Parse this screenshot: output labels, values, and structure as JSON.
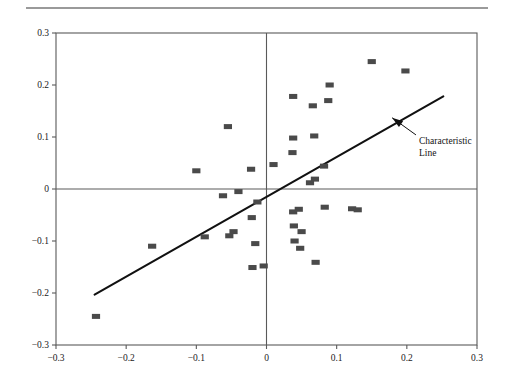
{
  "figure": {
    "title": "",
    "top_rule_color": "#9a9a9a",
    "background_color": "#ffffff"
  },
  "annotation": {
    "line1": "Characteristic",
    "line2": "Line"
  },
  "chart_data": {
    "type": "scatter",
    "title": "",
    "xlabel": "",
    "ylabel": "",
    "xlim": [
      -0.3,
      0.3
    ],
    "ylim": [
      -0.3,
      0.3
    ],
    "grid": false,
    "legend": null,
    "marker_color": "#4a4a4a",
    "marker_shape": "square",
    "axis_color": "#5a5a5a",
    "line_color": "#111111",
    "xticks": [
      -0.3,
      -0.2,
      -0.1,
      0,
      0.1,
      0.2,
      0.3
    ],
    "xtick_labels": [
      "-0.3",
      "-0.2",
      "-0.1",
      "0",
      "0.1",
      "0.2",
      "0.3"
    ],
    "yticks": [
      -0.3,
      -0.2,
      -0.1,
      0,
      0.1,
      0.2,
      0.3
    ],
    "ytick_labels": [
      "-0.3",
      "-0.2",
      "-0.1",
      "0",
      "0.1",
      "0.2",
      "0.3"
    ],
    "zero_lines": {
      "x": 0,
      "y": 0
    },
    "points": [
      [
        -0.243,
        -0.245
      ],
      [
        -0.163,
        -0.11
      ],
      [
        -0.1,
        0.035
      ],
      [
        -0.088,
        -0.092
      ],
      [
        -0.062,
        -0.013
      ],
      [
        -0.055,
        0.12
      ],
      [
        -0.053,
        -0.09
      ],
      [
        -0.047,
        -0.082
      ],
      [
        -0.04,
        -0.005
      ],
      [
        -0.022,
        0.038
      ],
      [
        -0.021,
        -0.055
      ],
      [
        -0.02,
        -0.151
      ],
      [
        -0.016,
        -0.105
      ],
      [
        -0.013,
        -0.025
      ],
      [
        -0.004,
        -0.148
      ],
      [
        0.01,
        0.047
      ],
      [
        0.037,
        0.07
      ],
      [
        0.038,
        0.098
      ],
      [
        0.038,
        0.178
      ],
      [
        0.038,
        -0.044
      ],
      [
        0.039,
        -0.071
      ],
      [
        0.04,
        -0.1
      ],
      [
        0.046,
        -0.039
      ],
      [
        0.048,
        -0.114
      ],
      [
        0.05,
        -0.082
      ],
      [
        0.062,
        0.012
      ],
      [
        0.066,
        0.16
      ],
      [
        0.068,
        0.102
      ],
      [
        0.069,
        0.019
      ],
      [
        0.07,
        -0.141
      ],
      [
        0.082,
        0.044
      ],
      [
        0.083,
        -0.035
      ],
      [
        0.088,
        0.17
      ],
      [
        0.09,
        0.2
      ],
      [
        0.122,
        -0.038
      ],
      [
        0.13,
        -0.04
      ],
      [
        0.15,
        0.245
      ],
      [
        0.198,
        0.227
      ]
    ],
    "characteristic_line": {
      "label": "Characteristic Line",
      "x0": -0.245,
      "y0": -0.203,
      "x1": 0.252,
      "y1": 0.178
    },
    "arrow": {
      "tail_x": 0.213,
      "tail_y": 0.104,
      "head_x": 0.179,
      "head_y": 0.137
    }
  }
}
